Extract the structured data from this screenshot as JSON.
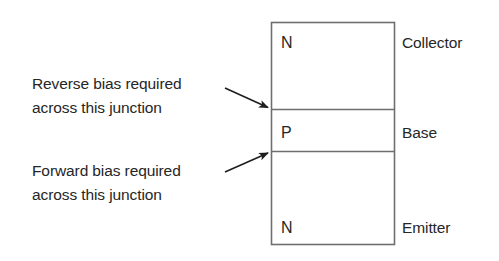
{
  "diagram": {
    "type": "npn-transistor-bias",
    "regions": [
      {
        "letter": "N",
        "name": "Collector"
      },
      {
        "letter": "P",
        "name": "Base"
      },
      {
        "letter": "N",
        "name": "Emitter"
      }
    ],
    "annotations": [
      {
        "line1": "Reverse bias required",
        "line2": "across this junction",
        "junction": "collector-base"
      },
      {
        "line1": "Forward bias required",
        "line2": "across this junction",
        "junction": "base-emitter"
      }
    ],
    "colors": {
      "stroke": "#6e6e6e",
      "text": "#262626",
      "arrow": "#1e1e1e"
    }
  }
}
